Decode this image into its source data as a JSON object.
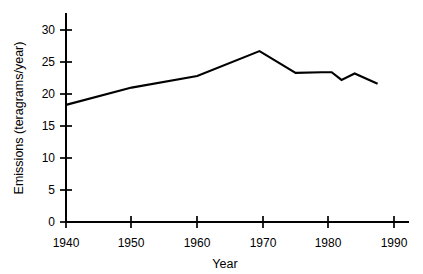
{
  "chart_data": {
    "type": "line",
    "title": "",
    "xlabel": "Year",
    "ylabel": "Emissions (teragrams/year)",
    "xlim": [
      1940,
      1992
    ],
    "ylim": [
      0,
      32
    ],
    "grid": false,
    "legend": "none",
    "xticks": [
      1940,
      1950,
      1960,
      1970,
      1980,
      1990
    ],
    "xtick_labels": [
      "1940",
      "1950",
      "1960",
      "1970",
      "1980",
      "1990"
    ],
    "yticks": [
      0,
      5,
      10,
      15,
      20,
      25,
      30
    ],
    "ytick_labels": [
      "0",
      "5",
      "10",
      "15",
      "20",
      "25",
      "30"
    ],
    "series": [
      {
        "name": "Emissions",
        "color": "#000000",
        "x": [
          1940,
          1950,
          1960,
          1969.5,
          1975,
          1979,
          1980.5,
          1982,
          1984,
          1987.5
        ],
        "values": [
          18.3,
          21.0,
          22.8,
          26.7,
          23.3,
          23.4,
          23.4,
          22.2,
          23.2,
          21.6
        ]
      }
    ]
  },
  "axes": {
    "x_title": "Year",
    "y_title": "Emissions (teragrams/year)"
  }
}
